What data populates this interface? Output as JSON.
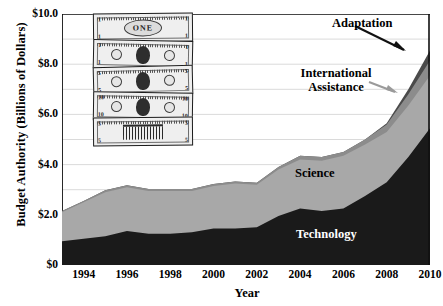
{
  "chart_data": {
    "type": "area",
    "title": "",
    "xlabel": "Year",
    "ylabel": "Budget Authority (Billions of Dollars)",
    "xlim": [
      1993,
      2010
    ],
    "ylim": [
      0,
      10
    ],
    "grid": "horizontal-major",
    "legend_position": "inline-annotations",
    "stacked": true,
    "x": [
      1993,
      1994,
      1995,
      1996,
      1997,
      1998,
      1999,
      2000,
      2001,
      2002,
      2003,
      2004,
      2005,
      2006,
      2007,
      2008,
      2009,
      2010
    ],
    "series": [
      {
        "name": "Technology",
        "color": "#1a1a1a",
        "values": [
          0.95,
          1.05,
          1.15,
          1.35,
          1.25,
          1.25,
          1.3,
          1.45,
          1.45,
          1.5,
          1.95,
          2.25,
          2.15,
          2.25,
          2.75,
          3.3,
          4.3,
          5.45
        ]
      },
      {
        "name": "Science",
        "color": "#a8a8a8",
        "values": [
          1.15,
          1.45,
          1.75,
          1.75,
          1.7,
          1.7,
          1.65,
          1.7,
          1.8,
          1.7,
          1.85,
          1.95,
          2.0,
          2.1,
          2.05,
          2.0,
          2.05,
          2.1
        ]
      },
      {
        "name": "International Assistance",
        "color": "#8c8c8c",
        "values": [
          0.05,
          0.05,
          0.08,
          0.08,
          0.08,
          0.08,
          0.08,
          0.08,
          0.08,
          0.08,
          0.1,
          0.15,
          0.15,
          0.15,
          0.2,
          0.3,
          0.45,
          0.6
        ]
      },
      {
        "name": "Adaptation",
        "color": "#4a4a4a",
        "values": [
          0.0,
          0.0,
          0.0,
          0.0,
          0.0,
          0.0,
          0.0,
          0.0,
          0.0,
          0.0,
          0.0,
          0.0,
          0.0,
          0.0,
          0.0,
          0.05,
          0.2,
          0.4
        ]
      }
    ],
    "ytick_values": [
      0,
      2,
      4,
      6,
      8,
      10
    ],
    "ytick_labels": [
      "$0",
      "$2.0",
      "$4.0",
      "$6.0",
      "$8.0",
      "$10.0"
    ],
    "yminor_values": [
      1,
      3,
      5,
      7,
      9
    ],
    "xtick_values": [
      1994,
      1996,
      1998,
      2000,
      2002,
      2004,
      2006,
      2008,
      2010
    ],
    "xtick_labels": [
      "1994",
      "1996",
      "1998",
      "2000",
      "2002",
      "2004",
      "2006",
      "2008",
      "2010"
    ],
    "xminor_values": [
      1993,
      1995,
      1997,
      1999,
      2001,
      2003,
      2005,
      2007,
      2009
    ],
    "annotations": [
      {
        "name": "adaptation",
        "text": "Adaptation",
        "arrow": "black"
      },
      {
        "name": "international-assistance",
        "text": "International\nAssistance",
        "arrow": "gray"
      },
      {
        "name": "science",
        "text": "Science",
        "arrow": "none"
      },
      {
        "name": "technology",
        "text": "Technology",
        "arrow": "none"
      }
    ]
  },
  "decoration": {
    "money_stack": {
      "name": "dollar-bills-image",
      "bills": [
        {
          "label": "ONE",
          "corner": "1",
          "style": "word"
        },
        {
          "label": "",
          "corner": "1",
          "style": "portrait"
        },
        {
          "label": "",
          "corner": "5",
          "style": "portrait"
        },
        {
          "label": "",
          "corner": "10",
          "style": "portrait"
        },
        {
          "label": "",
          "corner": "5",
          "style": "building"
        }
      ]
    }
  }
}
